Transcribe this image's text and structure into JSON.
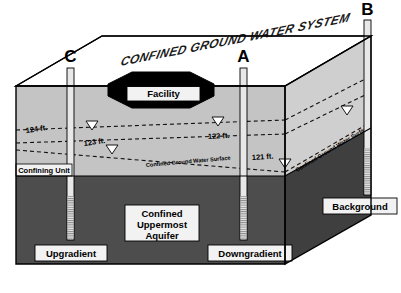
{
  "figure": {
    "title": "CONFINED GROUND WATER SYSTEM",
    "facility_label": "Facility",
    "confining_unit_label": "Confining Unit",
    "aquifer_label_line1": "Confined",
    "aquifer_label_line2": "Uppermost",
    "aquifer_label_line3": "Aquifer",
    "surface_label_front": "Confined Ground Water Surface",
    "surface_label_side": "Confined Ground Water Surface"
  },
  "wells": [
    {
      "id": "well-c",
      "letter": "C",
      "position_label": "Upgradient",
      "head_ft": "124 ft."
    },
    {
      "id": "well-a",
      "letter": "A",
      "position_label": "Downgradient",
      "head_ft": "122 ft."
    },
    {
      "id": "well-b",
      "letter": "B",
      "position_label": "Background",
      "head_ft": "121 ft."
    }
  ],
  "contours": [
    {
      "id": "contour-124",
      "label": "124 ft."
    },
    {
      "id": "contour-123",
      "label": "123 ft."
    },
    {
      "id": "contour-122",
      "label": "122 ft."
    },
    {
      "id": "contour-121",
      "label": "121 ft."
    }
  ],
  "colors": {
    "top_surface": "#ffffff",
    "confining_unit": "#c4c4c4",
    "aquifer": "#4d4d4d",
    "facility": "#000000",
    "outline": "#000000",
    "label_box": "#f2f2f2",
    "well_casing": "#e8e8e8"
  }
}
